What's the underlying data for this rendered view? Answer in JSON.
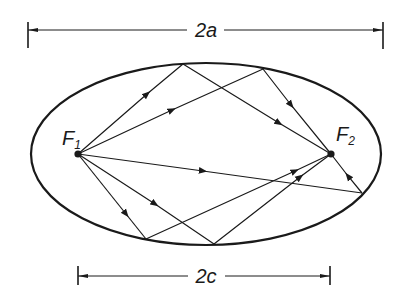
{
  "diagram": {
    "colors": {
      "ink": "#1a1a1a",
      "background": "#ffffff"
    },
    "dimensions": {
      "major_axis": {
        "label": "2a"
      },
      "focal_distance": {
        "label": "2c"
      }
    },
    "foci": [
      {
        "id": "F1",
        "letter": "F",
        "subscript": "1"
      },
      {
        "id": "F2",
        "letter": "F",
        "subscript": "2"
      }
    ],
    "rays": [
      {
        "from": "F1",
        "to": "top-reflection-1",
        "then": "F2"
      },
      {
        "from": "F1",
        "to": "top-reflection-2",
        "then": "F2"
      },
      {
        "from": "F1",
        "to": "right-reflection",
        "then": "F2"
      },
      {
        "from": "F1",
        "to": "bottom-reflection-1",
        "then": "F2"
      },
      {
        "from": "F1",
        "to": "bottom-reflection-2",
        "then": "F2"
      }
    ]
  }
}
